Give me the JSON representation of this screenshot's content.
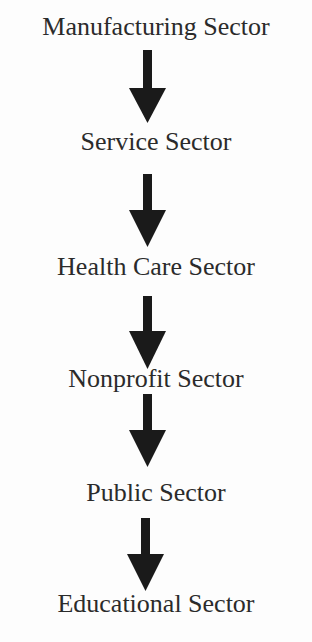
{
  "diagram": {
    "type": "vertical-flow",
    "direction": "top-to-bottom",
    "colors": {
      "background": "#fdfdfd",
      "text": "#2b2b2b",
      "arrow": "#1a1a1a"
    },
    "nodes": [
      {
        "id": "manufacturing",
        "label": "Manufacturing Sector"
      },
      {
        "id": "service",
        "label": "Service Sector"
      },
      {
        "id": "health-care",
        "label": "Health Care Sector"
      },
      {
        "id": "nonprofit",
        "label": "Nonprofit Sector"
      },
      {
        "id": "public",
        "label": "Public Sector"
      },
      {
        "id": "educational",
        "label": "Educational Sector"
      }
    ],
    "edges": [
      {
        "from": "Manufacturing Sector",
        "to": "Service Sector",
        "style": "down-arrow"
      },
      {
        "from": "Service Sector",
        "to": "Health Care Sector",
        "style": "down-arrow"
      },
      {
        "from": "Health Care Sector",
        "to": "Nonprofit Sector",
        "style": "down-arrow"
      },
      {
        "from": "Nonprofit Sector",
        "to": "Public Sector",
        "style": "down-arrow"
      },
      {
        "from": "Public Sector",
        "to": "Educational Sector",
        "style": "down-arrow"
      }
    ]
  }
}
